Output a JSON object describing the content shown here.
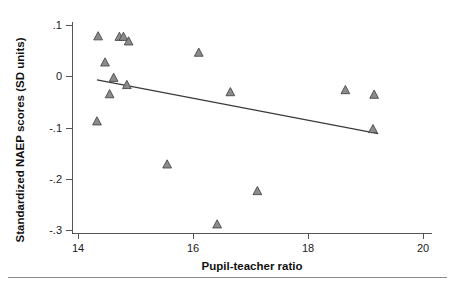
{
  "chart_data": {
    "type": "scatter",
    "title": "",
    "xlabel": "Pupil-teacher ratio",
    "ylabel": "Standardized NAEP scores (SD units)",
    "xlim": [
      14,
      20
    ],
    "ylim": [
      -0.3,
      0.1
    ],
    "xticks": [
      14,
      16,
      18,
      20
    ],
    "xtick_labels": [
      "14",
      "16",
      "18",
      "20"
    ],
    "yticks": [
      0.1,
      0,
      -0.1,
      -0.2,
      -0.3
    ],
    "ytick_labels": [
      ".1",
      "0",
      "-.1",
      "-.2",
      "-.3"
    ],
    "grid": false,
    "legend": false,
    "marker": "triangle",
    "marker_color": "#8b8b8b",
    "marker_edge_color": "#4a4a4a",
    "points": [
      {
        "x": 14.35,
        "y": 0.078
      },
      {
        "x": 14.47,
        "y": 0.027
      },
      {
        "x": 14.55,
        "y": -0.035
      },
      {
        "x": 14.62,
        "y": -0.003
      },
      {
        "x": 14.72,
        "y": 0.077
      },
      {
        "x": 14.79,
        "y": 0.077
      },
      {
        "x": 14.88,
        "y": 0.068
      },
      {
        "x": 14.85,
        "y": -0.017
      },
      {
        "x": 14.33,
        "y": -0.088
      },
      {
        "x": 15.55,
        "y": -0.172
      },
      {
        "x": 16.1,
        "y": 0.046
      },
      {
        "x": 16.42,
        "y": -0.289
      },
      {
        "x": 16.65,
        "y": -0.031
      },
      {
        "x": 17.12,
        "y": -0.224
      },
      {
        "x": 18.65,
        "y": -0.027
      },
      {
        "x": 19.15,
        "y": -0.036
      },
      {
        "x": 19.13,
        "y": -0.103
      }
    ],
    "fit_line": {
      "label": "regression line",
      "x_start": 14.33,
      "y_start": -0.007,
      "x_end": 19.22,
      "y_end": -0.112
    }
  },
  "axes": {
    "y_title": "Standardized NAEP scores (SD units)",
    "x_title": "Pupil-teacher ratio",
    "y_tick_0": ".1",
    "y_tick_1": "0",
    "y_tick_2": "-.1",
    "y_tick_3": "-.2",
    "y_tick_4": "-.3",
    "x_tick_0": "14",
    "x_tick_1": "16",
    "x_tick_2": "18",
    "x_tick_3": "20"
  }
}
